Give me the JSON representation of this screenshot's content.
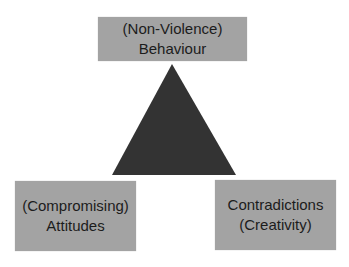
{
  "diagram": {
    "type": "conflict-triangle",
    "shape_color": "#333333",
    "box_color": "#a3a3a3",
    "nodes": [
      {
        "id": "top",
        "lines": [
          "(Non-Violence)",
          "Behaviour"
        ]
      },
      {
        "id": "left",
        "lines": [
          "(Compromising)",
          "Attitudes"
        ]
      },
      {
        "id": "right",
        "lines": [
          "Contradictions",
          "(Creativity)"
        ]
      }
    ]
  }
}
